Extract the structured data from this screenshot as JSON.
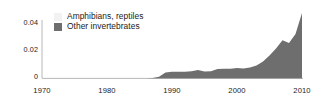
{
  "chart_data": {
    "type": "area",
    "title": "",
    "subtitle": "",
    "xlabel": "",
    "ylabel": "",
    "xlim": [
      1970,
      2010
    ],
    "ylim": [
      0,
      0.047
    ],
    "grid": false,
    "legend_position": "top-left",
    "x_ticks": [
      "1970",
      "1980",
      "1990",
      "2000",
      "2010"
    ],
    "x_tick_values": [
      1970,
      1980,
      1990,
      2000,
      2010
    ],
    "y_ticks": [
      "0",
      "0.02",
      "0.04"
    ],
    "y_tick_values": [
      0,
      0.02,
      0.04
    ],
    "colors": {
      "amphibians_reptiles": "#f2f2f2",
      "other_invertebrates": "#6e6e6e",
      "axis": "#808080",
      "text": "#1a1a1a",
      "background": "#ffffff"
    },
    "series": [
      {
        "name": "Amphibians, reptiles",
        "color": "#f2f2f2",
        "x": [
          1970,
          1980,
          1990,
          2000,
          2010
        ],
        "values": [
          0,
          0,
          0,
          0,
          0
        ]
      },
      {
        "name": "Other invertebrates",
        "color": "#6e6e6e",
        "x": [
          1970,
          1972,
          1974,
          1976,
          1978,
          1980,
          1982,
          1984,
          1986,
          1987,
          1988,
          1989,
          1990,
          1991,
          1992,
          1993,
          1994,
          1995,
          1996,
          1997,
          1998,
          1999,
          2000,
          2001,
          2002,
          2003,
          2004,
          2005,
          2006,
          2007,
          2008,
          2009,
          2010
        ],
        "values": [
          0,
          0,
          0,
          0,
          0,
          0,
          0,
          0,
          0,
          0.0002,
          0.0012,
          0.0042,
          0.0048,
          0.0048,
          0.0047,
          0.0052,
          0.006,
          0.005,
          0.0052,
          0.0068,
          0.007,
          0.0069,
          0.0075,
          0.0072,
          0.0078,
          0.0093,
          0.0122,
          0.0165,
          0.0215,
          0.0275,
          0.0255,
          0.032,
          0.047
        ]
      }
    ]
  },
  "legend": {
    "items": [
      {
        "label": "Amphibians, reptiles",
        "swatch_color": "#f2f2f2"
      },
      {
        "label": "Other invertebrates",
        "swatch_color": "#6e6e6e"
      }
    ]
  },
  "axes": {
    "y_labels": [
      "0.04",
      "0.02",
      "0"
    ],
    "x_labels": [
      "1970",
      "1980",
      "1990",
      "2000",
      "2010"
    ]
  }
}
